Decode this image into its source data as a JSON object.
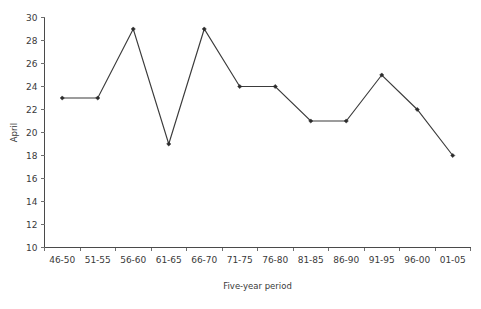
{
  "chart_data": {
    "type": "line",
    "title": "",
    "xlabel": "Five-year period",
    "ylabel": "April",
    "categories": [
      "46-50",
      "51-55",
      "56-60",
      "61-65",
      "66-70",
      "71-75",
      "76-80",
      "81-85",
      "86-90",
      "91-95",
      "96-00",
      "01-05"
    ],
    "values": [
      23,
      23,
      29,
      19,
      29,
      24,
      24,
      21,
      21,
      25,
      22,
      18
    ],
    "series": [
      {
        "name": "April",
        "values": [
          23,
          23,
          29,
          19,
          29,
          24,
          24,
          21,
          21,
          25,
          22,
          18
        ]
      }
    ],
    "ylim": [
      10,
      30
    ],
    "ytick_step": 2,
    "yticks": [
      10,
      12,
      14,
      16,
      18,
      20,
      22,
      24,
      26,
      28,
      30
    ],
    "ytick_labels": [
      "10",
      "12",
      "14",
      "16",
      "18",
      "20",
      "22",
      "24",
      "26",
      "28",
      "30"
    ],
    "grid": false,
    "legend": false,
    "legend_position": "none",
    "marker": "filled-diamond",
    "line_color": "#3b3b3b",
    "marker_color": "#2b2b2b",
    "axis_color": "#4a4a4a",
    "text_color": "#3a3a3a",
    "background_color": "#ffffff"
  }
}
